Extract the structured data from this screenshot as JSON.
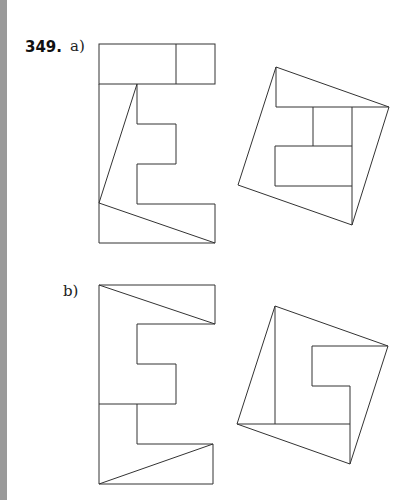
{
  "problem": {
    "number": "349.",
    "parts": [
      {
        "label": "a)",
        "description": "Letter E shape dissected into pieces rearranged into a tilted square with inner rectangles"
      },
      {
        "label": "b)",
        "description": "Letter E variant dissected into pieces rearranged into a tilted square with inner notch"
      }
    ]
  },
  "colors": {
    "stroke": "#333333",
    "side_bar": "#9a9a9a",
    "background": "#ffffff"
  }
}
